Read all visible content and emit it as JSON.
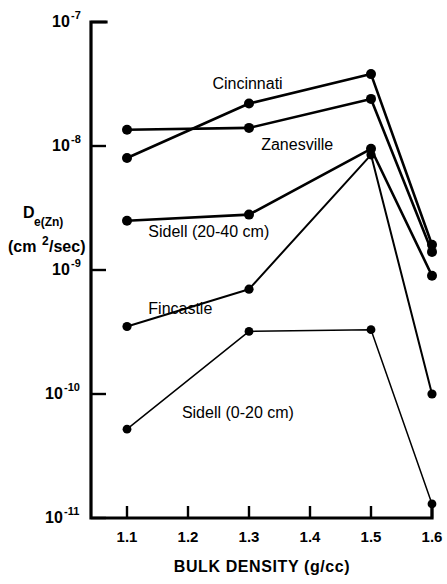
{
  "chart_data": {
    "type": "line",
    "title": "",
    "xlabel": "BULK DENSITY (g/cc)",
    "ylabel_main": "D",
    "ylabel_sub": "e(Zn)",
    "ylabel_units": "(cm2/sec)",
    "ylabel_units_base": "(cm",
    "ylabel_units_sup": "2",
    "ylabel_units_tail": "/sec)",
    "x": [
      1.1,
      1.2,
      1.3,
      1.4,
      1.5,
      1.6
    ],
    "xtick_labels": [
      "1.1",
      "1.2",
      "1.3",
      "1.4",
      "1.5",
      "1.6"
    ],
    "xlim": [
      1.05,
      1.6
    ],
    "ylim": [
      1e-11,
      1e-07
    ],
    "yscale": "log",
    "ytick_values": [
      1e-07,
      1e-08,
      1e-09,
      1e-10,
      1e-11
    ],
    "ytick_labels": [
      {
        "base": "10",
        "exp": "-7"
      },
      {
        "base": "10",
        "exp": "-8"
      },
      {
        "base": "10",
        "exp": "-9"
      },
      {
        "base": "10",
        "exp": "-10"
      },
      {
        "base": "10",
        "exp": "-11"
      }
    ],
    "grid": false,
    "legend_position": "inline-annotations",
    "marker": "filled-circle",
    "series": [
      {
        "name": "Cincinnati",
        "x": [
          1.1,
          1.3,
          1.5,
          1.6
        ],
        "values": [
          8e-09,
          2.2e-08,
          3.8e-08,
          1.6e-09
        ],
        "label_x": 1.24,
        "label_y": 2.9e-08
      },
      {
        "name": "Zanesville",
        "x": [
          1.1,
          1.3,
          1.5,
          1.6
        ],
        "values": [
          1.35e-08,
          1.4e-08,
          2.4e-08,
          1.4e-09
        ],
        "label_x": 1.32,
        "label_y": 9.3e-09
      },
      {
        "name": "Sidell (20-40 cm)",
        "x": [
          1.1,
          1.3,
          1.5,
          1.6
        ],
        "values": [
          2.5e-09,
          2.8e-09,
          9.5e-09,
          9e-10
        ],
        "label_x": 1.135,
        "label_y": 1.85e-09
      },
      {
        "name": "Fincastle",
        "x": [
          1.1,
          1.3,
          1.5,
          1.6
        ],
        "values": [
          3.5e-10,
          7e-10,
          8.5e-09,
          1e-10
        ],
        "label_x": 1.135,
        "label_y": 4.4e-10
      },
      {
        "name": "Sidell (0-20 cm)",
        "x": [
          1.1,
          1.3,
          1.5,
          1.6
        ],
        "values": [
          5.2e-11,
          3.2e-10,
          3.3e-10,
          1.3e-11
        ],
        "label_x": 1.19,
        "label_y": 6.4e-11
      }
    ]
  },
  "axis": {
    "x_axis_name": "bulk-density-axis",
    "y_axis_name": "diffusion-coefficient-axis"
  }
}
